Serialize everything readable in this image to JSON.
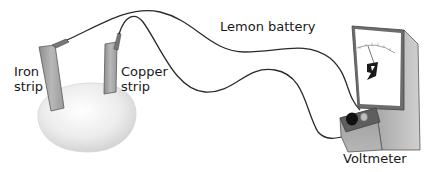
{
  "diagram": {
    "title": "Lemon battery",
    "labels": {
      "lemon_battery": "Lemon battery",
      "iron_strip": "Iron\nstrip",
      "copper_strip": "Copper\nstrip",
      "voltmeter": "Voltmeter"
    },
    "components": [
      {
        "name": "lemon",
        "kind": "fruit"
      },
      {
        "name": "iron-strip",
        "kind": "electrode",
        "material": "iron"
      },
      {
        "name": "copper-strip",
        "kind": "electrode",
        "material": "copper"
      },
      {
        "name": "wire-iron",
        "kind": "wire",
        "from": "iron-strip",
        "to": "voltmeter"
      },
      {
        "name": "wire-copper",
        "kind": "wire",
        "from": "copper-strip",
        "to": "voltmeter"
      },
      {
        "name": "voltmeter",
        "kind": "meter"
      }
    ],
    "colors": {
      "background": "#ffffff",
      "lemon": "#e8e8e8",
      "strip": "#a9a9a9",
      "wire": "#2a2a2a",
      "meter_body": "#9a9a9a",
      "meter_face": "#ffffff",
      "text": "#1a1a1a"
    }
  }
}
